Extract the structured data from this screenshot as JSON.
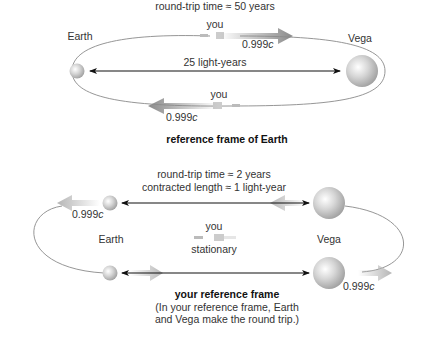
{
  "earth_frame": {
    "round_trip": "round-trip time ≈ 50 years",
    "earth_label": "Earth",
    "vega_label": "Vega",
    "distance": "25 light-years",
    "you_out": "you",
    "you_back": "you",
    "speed_out_num": "0.999",
    "speed_out_unit": "c",
    "speed_back_num": "0.999",
    "speed_back_unit": "c",
    "caption": "reference frame of Earth"
  },
  "your_frame": {
    "round_trip": "round-trip time ≈ 2 years",
    "contracted": "contracted length ≈ 1 light-year",
    "earth_label": "Earth",
    "vega_label": "Vega",
    "you": "you",
    "stationary": "stationary",
    "speed_earth_num": "0.999",
    "speed_earth_unit": "c",
    "speed_vega_num": "0.999",
    "speed_vega_unit": "c",
    "caption": "your reference frame",
    "note_line1": "(In your reference frame, Earth",
    "note_line2": "and Vega make the round trip.)"
  }
}
